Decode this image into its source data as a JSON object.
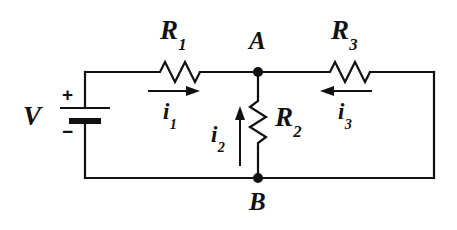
{
  "figure": {
    "type": "circuit-schematic",
    "background_color": "#ffffff",
    "ink_color": "#111111"
  },
  "source": {
    "symbol": "battery",
    "label": "V",
    "plus_sign": "+",
    "minus_sign": "−"
  },
  "resistors": [
    {
      "id": "R1",
      "letter": "R",
      "subscript": "1",
      "orientation": "horizontal",
      "branch": "top-left"
    },
    {
      "id": "R2",
      "letter": "R",
      "subscript": "2",
      "orientation": "vertical",
      "branch": "middle"
    },
    {
      "id": "R3",
      "letter": "R",
      "subscript": "3",
      "orientation": "horizontal",
      "branch": "top-right"
    }
  ],
  "currents": [
    {
      "id": "i1",
      "letter": "i",
      "subscript": "1",
      "direction": "right",
      "branch": "top-left"
    },
    {
      "id": "i2",
      "letter": "i",
      "subscript": "2",
      "direction": "up",
      "branch": "middle"
    },
    {
      "id": "i3",
      "letter": "i",
      "subscript": "3",
      "direction": "left",
      "branch": "top-right"
    }
  ],
  "nodes": [
    {
      "id": "A",
      "label": "A",
      "position": "top-middle"
    },
    {
      "id": "B",
      "label": "B",
      "position": "bottom-middle"
    }
  ]
}
